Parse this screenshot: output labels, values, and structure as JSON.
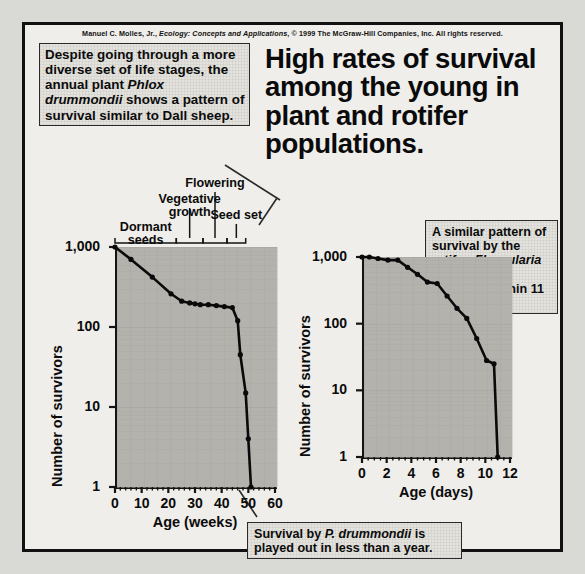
{
  "copyright": {
    "author": "Manuel C. Molles, Jr.,",
    "book": "Ecology: Concepts and Applications",
    "rights": ", © 1999 The McGraw-Hill Companies, Inc. All rights reserved."
  },
  "title": "High rates of survival among the young in plant and rotifer populations.",
  "callouts": {
    "phlox": {
      "part1": "Despite going through a more diverse set of life stages, the annual plant ",
      "species": "Phlox drummondii",
      "part2": " shows a pattern of survival similar to Dall sheep."
    },
    "rotifer": {
      "part1": "A similar pattern of survival by the rotifer, ",
      "species": "Floscularia conifera",
      "part2": ", is complete within 11 days."
    },
    "bottom": {
      "part1": "Survival by ",
      "species": "P. drummondii",
      "part2": " is played out in less than a year."
    }
  },
  "stage_labels": [
    {
      "key": "dormant-seeds",
      "text": "Dormant seeds"
    },
    {
      "key": "vegetative-growth",
      "text": "Vegetative growth"
    },
    {
      "key": "flowering",
      "text": "Flowering"
    },
    {
      "key": "seed-set",
      "text": "Seed set"
    }
  ],
  "chart_data": [
    {
      "id": "phlox-survivorship",
      "type": "line",
      "title": "",
      "xlabel": "Age (weeks)",
      "ylabel": "Number of survivors",
      "yscale": "log",
      "ylim": [
        1,
        1000
      ],
      "yticks": [
        1000,
        100,
        10,
        1
      ],
      "ytick_labels": [
        "1,000",
        "100",
        "10",
        "1"
      ],
      "xlim": [
        0,
        60
      ],
      "xticks": [
        0,
        10,
        20,
        30,
        40,
        50,
        60
      ],
      "xtick_labels": [
        "0",
        "10",
        "20",
        "30",
        "40",
        "50",
        "60"
      ],
      "xminor_step": 2,
      "grid": true,
      "legend": "none",
      "series": [
        {
          "name": "Phlox drummondii survivors",
          "x": [
            0,
            6,
            14,
            21,
            25,
            28,
            30,
            32,
            35,
            38,
            41,
            44,
            46,
            47,
            49,
            50,
            51
          ],
          "y": [
            1000,
            700,
            420,
            260,
            210,
            200,
            195,
            190,
            190,
            185,
            180,
            175,
            120,
            45,
            15,
            4,
            1
          ],
          "markers": true
        }
      ],
      "stage_brackets": [
        {
          "label": "Dormant seeds",
          "x_start": 0,
          "x_end": 23
        },
        {
          "label": "Vegetative growth",
          "x_start": 23,
          "x_end": 33
        },
        {
          "label": "Flowering",
          "x_start": 33,
          "x_end": 42
        },
        {
          "label": "Seed set",
          "x_start": 42,
          "x_end": 49
        }
      ]
    },
    {
      "id": "rotifer-survivorship",
      "type": "line",
      "title": "",
      "xlabel": "Age (days)",
      "ylabel": "Number of survivors",
      "yscale": "log",
      "ylim": [
        1,
        1000
      ],
      "yticks": [
        1000,
        100,
        10,
        1
      ],
      "ytick_labels": [
        "1,000",
        "100",
        "10",
        "1"
      ],
      "xlim": [
        0,
        12
      ],
      "xticks": [
        0,
        2,
        4,
        6,
        8,
        10,
        12
      ],
      "xtick_labels": [
        "0",
        "2",
        "4",
        "6",
        "8",
        "10",
        "12"
      ],
      "xminor_step": 0.5,
      "grid": true,
      "legend": "none",
      "series": [
        {
          "name": "Floscularia conifera survivors",
          "x": [
            0,
            0.6,
            1.3,
            2.1,
            2.9,
            3.7,
            4.5,
            5.3,
            6.1,
            6.9,
            7.7,
            8.5,
            9.3,
            10.1,
            10.7,
            11.0
          ],
          "y": [
            1000,
            1000,
            950,
            900,
            900,
            700,
            550,
            420,
            400,
            260,
            170,
            120,
            60,
            28,
            25,
            1
          ],
          "markers": true
        }
      ]
    }
  ]
}
